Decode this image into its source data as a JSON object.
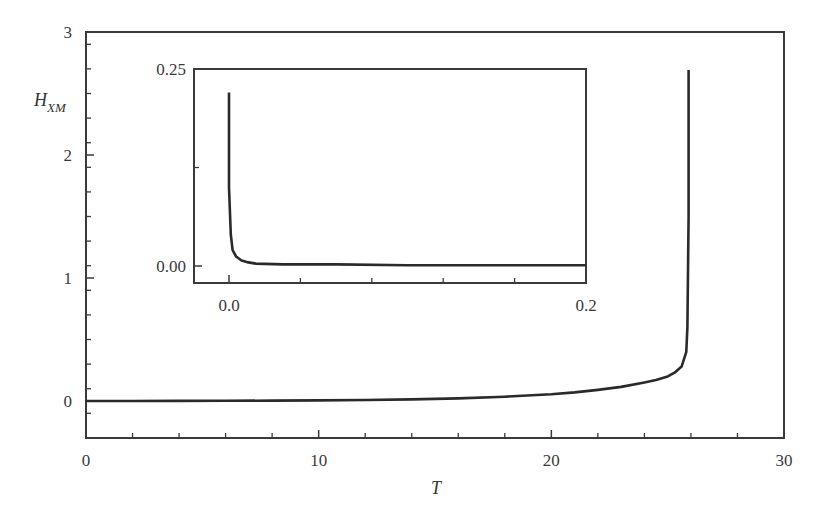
{
  "chart_data": [
    {
      "id": "main",
      "type": "line",
      "title": "",
      "xlabel": "T",
      "ylabel": "H_XM",
      "ylabel_main": "H",
      "ylabel_sub": "XM",
      "xlim": [
        0,
        30
      ],
      "ylim": [
        -0.3,
        3
      ],
      "xticks": [
        0,
        10,
        20,
        30
      ],
      "xtick_labels": [
        "0",
        "10",
        "20",
        "30"
      ],
      "yticks": [
        0,
        1,
        2,
        3
      ],
      "ytick_labels": [
        "0",
        "1",
        "2",
        "3"
      ],
      "minor_xtick_step": 2,
      "minor_ytick_step": 0.2,
      "grid": false,
      "legend": null,
      "series": [
        {
          "name": "H_XM(T)",
          "x": [
            0,
            2,
            4,
            6,
            8,
            10,
            12,
            14,
            16,
            18,
            20,
            21,
            22,
            23,
            24,
            24.5,
            25,
            25.3,
            25.6,
            25.8,
            25.85,
            25.9,
            25.9
          ],
          "y": [
            0.0,
            0.0,
            0.001,
            0.002,
            0.003,
            0.005,
            0.008,
            0.013,
            0.021,
            0.035,
            0.055,
            0.07,
            0.09,
            0.115,
            0.15,
            0.17,
            0.2,
            0.23,
            0.28,
            0.4,
            0.6,
            1.5,
            2.69
          ]
        }
      ]
    },
    {
      "id": "inset",
      "type": "line",
      "title": "",
      "xlabel": "",
      "ylabel": "",
      "xlim": [
        -0.02,
        0.2
      ],
      "ylim": [
        -0.02,
        0.25
      ],
      "xticks": [
        0.0,
        0.2
      ],
      "xtick_labels": [
        "0.0",
        "0.2"
      ],
      "yticks": [
        0.0,
        0.25
      ],
      "ytick_labels": [
        "0.00",
        "0.25"
      ],
      "minor_xtick_step": 0.04,
      "grid": false,
      "legend": null,
      "series": [
        {
          "name": "H_XM(T) near 0",
          "x": [
            0.0,
            0.0,
            0.001,
            0.002,
            0.004,
            0.007,
            0.01,
            0.015,
            0.03,
            0.06,
            0.1,
            0.15,
            0.2
          ],
          "y": [
            0.22,
            0.1,
            0.04,
            0.02,
            0.012,
            0.007,
            0.005,
            0.003,
            0.002,
            0.002,
            0.001,
            0.001,
            0.001
          ]
        }
      ]
    }
  ],
  "colors": {
    "line": "#2a2a2a",
    "axis": "#3a3a3a",
    "background": "#ffffff"
  }
}
